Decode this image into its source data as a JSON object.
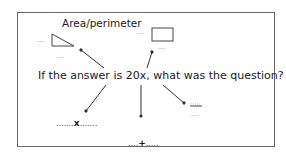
{
  "diagram": {
    "title": "Area/perimeter",
    "question": "If the answer is 20x, what was the question?",
    "blanks": {
      "triangle_side": "....",
      "triangle_base": "....",
      "rectangle_side": "....",
      "rectangle_base": "....",
      "fraction_top": "....",
      "fraction_bottom": "...."
    },
    "expressions": {
      "multiply_left": ".......",
      "multiply_op": "x",
      "multiply_right": ".......",
      "add_left": "....",
      "add_op": "+",
      "add_right": "....."
    },
    "shapes": [
      "triangle",
      "rectangle",
      "fraction-bar"
    ],
    "colors": {
      "border": "#666666",
      "text": "#222222",
      "arrow": "#333333"
    }
  }
}
